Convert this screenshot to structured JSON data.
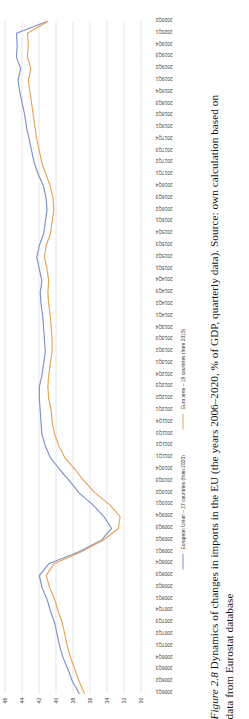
{
  "figure": {
    "number_label": "Figure 2.8",
    "caption_line1": "Dynamics of changes in imports in the EU (the years 2006–2020, % of GDP, quarterly data). Source: own calculation based on",
    "caption_line2": "data from Eurostat database"
  },
  "legend": {
    "position": "bottom",
    "items": [
      {
        "label": "European Union – 27 countries (from 2020)",
        "color": "#8090c8",
        "name": "legend-eu27"
      },
      {
        "label": "Euro area – 19 countries (from 2015)",
        "color": "#e8a358",
        "name": "legend-ea19"
      }
    ]
  },
  "axis": {
    "y_ticks": [
      "30",
      "32",
      "34",
      "36",
      "38",
      "40",
      "42",
      "44",
      "46"
    ],
    "y_min": 30,
    "y_max": 46
  },
  "chart_data": {
    "type": "line",
    "title": "",
    "xlabel": "",
    "ylabel": "",
    "ylim": [
      30,
      46
    ],
    "grid": true,
    "legend_position": "bottom",
    "categories": [
      "2006Q1",
      "2006Q2",
      "2006Q3",
      "2006Q4",
      "2007Q1",
      "2007Q2",
      "2007Q3",
      "2007Q4",
      "2008Q1",
      "2008Q2",
      "2008Q3",
      "2008Q4",
      "2009Q1",
      "2009Q2",
      "2009Q3",
      "2009Q4",
      "2010Q1",
      "2010Q2",
      "2010Q3",
      "2010Q4",
      "2011Q1",
      "2011Q2",
      "2011Q3",
      "2011Q4",
      "2012Q1",
      "2012Q2",
      "2012Q3",
      "2012Q4",
      "2013Q1",
      "2013Q2",
      "2013Q3",
      "2013Q4",
      "2014Q1",
      "2014Q2",
      "2014Q3",
      "2014Q4",
      "2015Q1",
      "2015Q2",
      "2015Q3",
      "2015Q4",
      "2016Q1",
      "2016Q2",
      "2016Q3",
      "2016Q4",
      "2017Q1",
      "2017Q2",
      "2017Q3",
      "2017Q4",
      "2018Q1",
      "2018Q2",
      "2018Q3",
      "2018Q4",
      "2019Q1",
      "2019Q2",
      "2019Q3",
      "2019Q4",
      "2020Q1",
      "2020Q2"
    ],
    "series": [
      {
        "name": "European Union – 27 countries (from 2020)",
        "color": "#8090c8",
        "values": [
          37.2,
          38.0,
          38.5,
          39.1,
          39.5,
          39.8,
          40.1,
          40.6,
          41.0,
          41.6,
          41.9,
          40.8,
          37.3,
          34.6,
          33.4,
          34.3,
          35.6,
          37.2,
          38.3,
          39.5,
          40.6,
          41.2,
          41.6,
          41.7,
          41.8,
          41.9,
          41.9,
          41.6,
          41.4,
          41.2,
          41.3,
          41.4,
          41.5,
          41.7,
          41.8,
          41.6,
          41.9,
          42.2,
          41.9,
          41.4,
          41.2,
          41.0,
          41.1,
          41.4,
          42.0,
          42.5,
          42.8,
          43.1,
          43.4,
          43.6,
          43.9,
          44.2,
          44.4,
          44.1,
          44.6,
          44.5,
          44.6,
          41.0
        ]
      },
      {
        "name": "Euro area – 19 countries (from 2015)",
        "color": "#e8a358",
        "values": [
          36.6,
          37.2,
          37.7,
          38.2,
          38.6,
          38.9,
          39.2,
          39.7,
          40.1,
          40.7,
          41.1,
          40.2,
          37.0,
          34.4,
          32.6,
          32.4,
          33.6,
          35.3,
          36.6,
          37.7,
          38.9,
          39.6,
          40.1,
          40.4,
          40.5,
          40.8,
          40.9,
          40.8,
          40.6,
          40.4,
          40.4,
          40.5,
          40.6,
          40.8,
          40.9,
          40.8,
          41.0,
          41.3,
          41.1,
          40.6,
          40.4,
          40.2,
          40.3,
          40.6,
          41.1,
          41.6,
          41.9,
          42.2,
          42.4,
          42.6,
          42.8,
          43.0,
          43.2,
          42.9,
          43.3,
          43.2,
          43.3,
          40.9
        ]
      }
    ]
  }
}
